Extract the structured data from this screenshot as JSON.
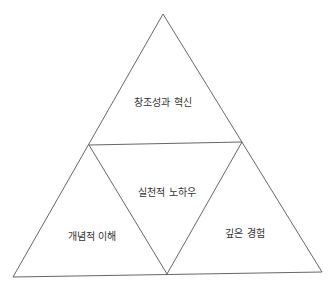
{
  "diagram": {
    "type": "triangle-pyramid",
    "sections": [
      {
        "id": "top",
        "label": "창조성과 혁신"
      },
      {
        "id": "center",
        "label": "실천적 노하우"
      },
      {
        "id": "bottom-left",
        "label": "개념적 이해"
      },
      {
        "id": "bottom-right",
        "label": "깊은 경험"
      }
    ],
    "colors": {
      "stroke": "#555555",
      "text": "#333333",
      "background": "#ffffff"
    }
  }
}
